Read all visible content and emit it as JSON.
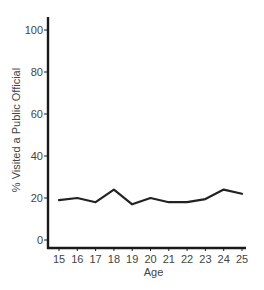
{
  "chart_data": {
    "type": "line",
    "title": "",
    "xlabel": "Age",
    "ylabel": "% Visited a Public Official",
    "x": [
      15,
      16,
      17,
      18,
      19,
      20,
      21,
      22,
      23,
      24,
      25
    ],
    "x_tick_labels": [
      "15",
      "16",
      "17",
      "18",
      "19",
      "20",
      "21",
      "22",
      "23",
      "24",
      "25"
    ],
    "y_ticks": [
      0,
      20,
      40,
      60,
      80,
      100
    ],
    "y_tick_labels": [
      "0",
      "20",
      "40",
      "60",
      "80",
      "100"
    ],
    "xlim": [
      15,
      25
    ],
    "ylim": [
      0,
      100
    ],
    "grid": false,
    "legend": "none",
    "series": [
      {
        "name": "% Visited a Public Official",
        "color": "#222222",
        "values": [
          19,
          20,
          18,
          24,
          17,
          20,
          18,
          18,
          19.5,
          24,
          22
        ]
      }
    ]
  }
}
